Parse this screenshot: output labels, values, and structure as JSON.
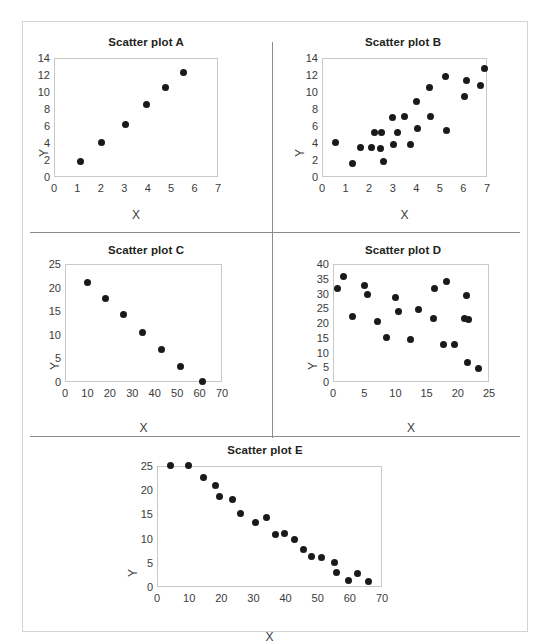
{
  "figure": {
    "background": "#ffffff",
    "point_color": "#1a1a1a",
    "axis_color": "#c8c8c8",
    "divider_color": "#8c8c8c",
    "frame_color": "#d3d3d3"
  },
  "chart_data": [
    {
      "id": "A",
      "type": "scatter",
      "title": "Scatter plot A",
      "xlabel": "X",
      "ylabel": "Y",
      "xlim": [
        0,
        7
      ],
      "ylim": [
        0,
        14
      ],
      "xticks": [
        0,
        1,
        2,
        3,
        4,
        5,
        6,
        7
      ],
      "yticks": [
        0,
        2,
        4,
        6,
        8,
        10,
        12,
        14
      ],
      "grid": false,
      "legend": "none",
      "points": [
        [
          1.1,
          2.0
        ],
        [
          2.0,
          4.2
        ],
        [
          3.0,
          6.3
        ],
        [
          3.9,
          8.6
        ],
        [
          4.7,
          10.7
        ],
        [
          5.5,
          12.4
        ]
      ]
    },
    {
      "id": "B",
      "type": "scatter",
      "title": "Scatter plot B",
      "xlabel": "X",
      "ylabel": "Y",
      "xlim": [
        0,
        7
      ],
      "ylim": [
        0,
        14
      ],
      "xticks": [
        0,
        1,
        2,
        3,
        4,
        5,
        6,
        7
      ],
      "yticks": [
        0,
        2,
        4,
        6,
        8,
        10,
        12,
        14
      ],
      "grid": false,
      "legend": "none",
      "points": [
        [
          0.55,
          4.2
        ],
        [
          1.25,
          1.7
        ],
        [
          1.6,
          3.6
        ],
        [
          2.05,
          3.6
        ],
        [
          2.2,
          5.4
        ],
        [
          2.45,
          3.5
        ],
        [
          2.5,
          5.3
        ],
        [
          2.55,
          2.0
        ],
        [
          2.95,
          7.1
        ],
        [
          3.0,
          4.0
        ],
        [
          3.15,
          5.3
        ],
        [
          3.45,
          7.2
        ],
        [
          3.7,
          4.0
        ],
        [
          3.95,
          9.0
        ],
        [
          4.0,
          5.8
        ],
        [
          4.5,
          10.7
        ],
        [
          4.55,
          7.2
        ],
        [
          5.2,
          12.0
        ],
        [
          5.25,
          5.6
        ],
        [
          6.0,
          9.6
        ],
        [
          6.1,
          11.5
        ],
        [
          6.7,
          10.9
        ],
        [
          6.85,
          12.9
        ]
      ]
    },
    {
      "id": "C",
      "type": "scatter",
      "title": "Scatter plot C",
      "xlabel": "X",
      "ylabel": "Y",
      "xlim": [
        0,
        70
      ],
      "ylim": [
        0,
        25
      ],
      "xticks": [
        0,
        10,
        20,
        30,
        40,
        50,
        60,
        70
      ],
      "yticks": [
        0,
        5,
        10,
        15,
        20,
        25
      ],
      "grid": false,
      "legend": "none",
      "points": [
        [
          9.5,
          21.3
        ],
        [
          17.5,
          18.0
        ],
        [
          25.5,
          14.6
        ],
        [
          34.0,
          10.7
        ],
        [
          42.5,
          7.2
        ],
        [
          51.0,
          3.5
        ],
        [
          61.0,
          0.3
        ]
      ]
    },
    {
      "id": "D",
      "type": "scatter",
      "title": "Scatter plot D",
      "xlabel": "X",
      "ylabel": "Y",
      "xlim": [
        0,
        25
      ],
      "ylim": [
        0,
        40
      ],
      "xticks": [
        0,
        5,
        10,
        15,
        20,
        25
      ],
      "yticks": [
        0,
        5,
        10,
        15,
        20,
        25,
        30,
        35,
        40
      ],
      "grid": false,
      "legend": "none",
      "points": [
        [
          0.6,
          32.0
        ],
        [
          1.5,
          36.0
        ],
        [
          3.0,
          22.4
        ],
        [
          4.9,
          33.0
        ],
        [
          5.4,
          30.0
        ],
        [
          7.0,
          21.0
        ],
        [
          8.4,
          15.5
        ],
        [
          9.9,
          29.0
        ],
        [
          10.4,
          24.2
        ],
        [
          12.2,
          14.8
        ],
        [
          13.6,
          24.8
        ],
        [
          16.0,
          22.0
        ],
        [
          16.1,
          32.0
        ],
        [
          17.5,
          13.2
        ],
        [
          18.0,
          34.3
        ],
        [
          19.3,
          12.9
        ],
        [
          20.9,
          21.8
        ],
        [
          21.2,
          29.7
        ],
        [
          21.4,
          7.0
        ],
        [
          21.6,
          21.4
        ],
        [
          23.2,
          5.0
        ]
      ]
    },
    {
      "id": "E",
      "type": "scatter",
      "title": "Scatter plot E",
      "xlabel": "X",
      "ylabel": "Y",
      "xlim": [
        0,
        70
      ],
      "ylim": [
        0,
        25
      ],
      "xticks": [
        0,
        10,
        20,
        30,
        40,
        50,
        60,
        70
      ],
      "yticks": [
        0,
        5,
        10,
        15,
        20,
        25
      ],
      "grid": false,
      "legend": "none",
      "points": [
        [
          3.8,
          25.4
        ],
        [
          9.4,
          25.3
        ],
        [
          14.3,
          22.8
        ],
        [
          18.0,
          21.2
        ],
        [
          19.2,
          19.0
        ],
        [
          23.3,
          18.2
        ],
        [
          25.8,
          15.4
        ],
        [
          30.3,
          13.5
        ],
        [
          33.6,
          14.5
        ],
        [
          36.5,
          11.0
        ],
        [
          39.2,
          11.3
        ],
        [
          42.4,
          10.0
        ],
        [
          45.3,
          8.0
        ],
        [
          47.8,
          6.6
        ],
        [
          51.0,
          6.4
        ],
        [
          55.0,
          5.3
        ],
        [
          55.6,
          3.1
        ],
        [
          59.3,
          1.5
        ],
        [
          62.2,
          3.0
        ],
        [
          65.6,
          1.3
        ]
      ]
    }
  ]
}
